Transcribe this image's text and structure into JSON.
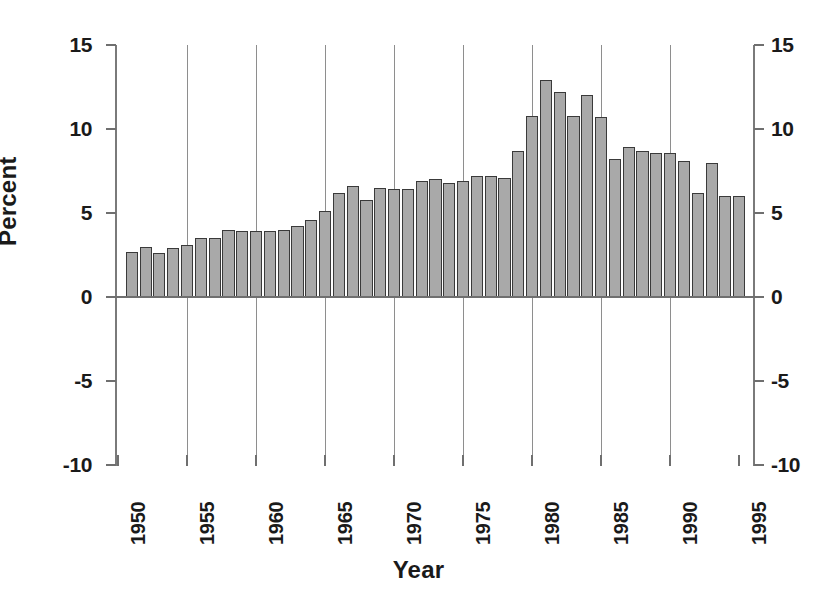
{
  "chart_data": {
    "type": "bar",
    "title": "",
    "xlabel": "Year",
    "ylabel": "Percent",
    "xlim": [
      1950,
      1996
    ],
    "ylim": [
      -10,
      15
    ],
    "ytick_labels": [
      "15",
      "10",
      "5",
      "0",
      "-5",
      "-10"
    ],
    "yticks": [
      15,
      10,
      5,
      0,
      -5,
      -10
    ],
    "xtick_labels": [
      "1950",
      "1955",
      "1960",
      "1965",
      "1970",
      "1975",
      "1980",
      "1985",
      "1990",
      "1995"
    ],
    "xticks": [
      1950,
      1955,
      1960,
      1965,
      1970,
      1975,
      1980,
      1985,
      1990,
      1995
    ],
    "grid": "vertical gridlines at each labeled year from 1955 to 1990",
    "gridline_years": [
      1955,
      1960,
      1965,
      1970,
      1975,
      1980,
      1985,
      1990
    ],
    "legend": "none",
    "bar_fill_color": "#a9a9a9",
    "bar_edge_color": "#3a3a3a",
    "axis_color": "#6f6f6f",
    "gridline_color": "#8e8e8e",
    "background_color": "#ffffff",
    "dual_y_axis": true,
    "categories": [
      1951,
      1952,
      1953,
      1954,
      1955,
      1956,
      1957,
      1958,
      1959,
      1960,
      1961,
      1962,
      1963,
      1964,
      1965,
      1966,
      1967,
      1968,
      1969,
      1970,
      1971,
      1972,
      1973,
      1974,
      1975,
      1976,
      1977,
      1978,
      1979,
      1980,
      1981,
      1982,
      1983,
      1984,
      1985,
      1986,
      1987,
      1988,
      1989,
      1990,
      1991,
      1992,
      1993,
      1994,
      1995
    ],
    "values": [
      2.7,
      3.0,
      2.6,
      2.9,
      3.1,
      3.5,
      3.5,
      4.0,
      3.9,
      3.9,
      3.9,
      4.0,
      4.2,
      4.6,
      5.1,
      6.2,
      6.6,
      5.8,
      6.5,
      6.4,
      6.4,
      6.9,
      7.0,
      6.8,
      6.9,
      7.2,
      7.2,
      7.1,
      8.7,
      10.8,
      12.9,
      12.2,
      10.8,
      12.0,
      10.7,
      8.2,
      8.9,
      8.7,
      8.6,
      8.6,
      8.1,
      6.2,
      8.0,
      6.0,
      6.0
    ]
  },
  "axis_titles": {
    "x": "Year",
    "y": "Percent"
  }
}
